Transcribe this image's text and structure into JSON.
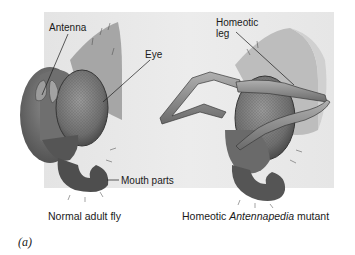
{
  "figure": {
    "panel_letter": "(a)",
    "left": {
      "caption": "Normal adult fly",
      "labels": {
        "antenna": "Antenna",
        "eye": "Eye",
        "mouth_parts": "Mouth parts"
      }
    },
    "right": {
      "caption_prefix": "Homeotic ",
      "caption_italic": "Antennapedia",
      "caption_suffix": " mutant",
      "labels": {
        "homeotic_leg_line1": "Homeotic",
        "homeotic_leg_line2": "leg"
      }
    },
    "colors": {
      "panel_bg": "#e8e8e8",
      "head_dark": "#5a5a5a",
      "eye": "#7a7a7a",
      "text": "#1a1a1a"
    }
  }
}
